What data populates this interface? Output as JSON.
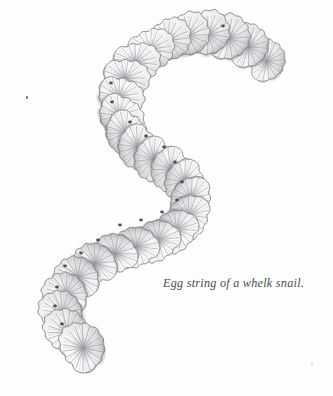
{
  "plate": {
    "medium": "graphite pencil drawing",
    "background_color": "#fefefe",
    "width": 333,
    "height": 396
  },
  "caption": {
    "text": "Egg string of a whelk snail.",
    "color": "#4c4c50",
    "style": "italic-serif",
    "x": 163,
    "y": 276
  },
  "illustration": {
    "subject": "egg string of a whelk snail",
    "name": "whelk-egg-string",
    "form": "S-curve chain of overlapping disc-shaped egg capsules",
    "capsule_count": 27,
    "ink_color": "#7d7d82",
    "shade_color": "#9a9aa0",
    "fill_color": "#fafafa",
    "aperture_color": "#3f3f44",
    "path": [
      {
        "x": 268,
        "y": 62,
        "r": 21,
        "rot": -72
      },
      {
        "x": 250,
        "y": 48,
        "r": 22,
        "rot": -64
      },
      {
        "x": 230,
        "y": 40,
        "r": 23,
        "rot": -52
      },
      {
        "x": 209,
        "y": 36,
        "r": 23,
        "rot": -40
      },
      {
        "x": 188,
        "y": 37,
        "r": 23,
        "rot": -28
      },
      {
        "x": 168,
        "y": 42,
        "r": 23,
        "rot": -14
      },
      {
        "x": 150,
        "y": 51,
        "r": 23,
        "rot": 2
      },
      {
        "x": 135,
        "y": 64,
        "r": 23,
        "rot": 16
      },
      {
        "x": 124,
        "y": 80,
        "r": 23,
        "rot": 28
      },
      {
        "x": 118,
        "y": 98,
        "r": 23,
        "rot": 40
      },
      {
        "x": 118,
        "y": 116,
        "r": 23,
        "rot": 54
      },
      {
        "x": 124,
        "y": 133,
        "r": 23,
        "rot": 66
      },
      {
        "x": 136,
        "y": 147,
        "r": 23,
        "rot": 76
      },
      {
        "x": 152,
        "y": 159,
        "r": 23,
        "rot": 84
      },
      {
        "x": 169,
        "y": 169,
        "r": 23,
        "rot": 90
      },
      {
        "x": 183,
        "y": 181,
        "r": 23,
        "rot": 100
      },
      {
        "x": 190,
        "y": 197,
        "r": 23,
        "rot": 118
      },
      {
        "x": 188,
        "y": 214,
        "r": 23,
        "rot": 136
      },
      {
        "x": 176,
        "y": 228,
        "r": 23,
        "rot": 152
      },
      {
        "x": 158,
        "y": 238,
        "r": 23,
        "rot": 164
      },
      {
        "x": 137,
        "y": 245,
        "r": 23,
        "rot": 176
      },
      {
        "x": 116,
        "y": 252,
        "r": 23,
        "rot": 188
      },
      {
        "x": 96,
        "y": 262,
        "r": 23,
        "rot": 200
      },
      {
        "x": 79,
        "y": 276,
        "r": 23,
        "rot": 212
      },
      {
        "x": 68,
        "y": 293,
        "r": 23,
        "rot": 224
      },
      {
        "x": 64,
        "y": 312,
        "r": 23,
        "rot": 238
      },
      {
        "x": 69,
        "y": 332,
        "r": 24,
        "rot": 250
      },
      {
        "x": 85,
        "y": 348,
        "r": 25,
        "rot": 260
      }
    ],
    "apertures": [
      {
        "x": 111,
        "y": 83
      },
      {
        "x": 112,
        "y": 102
      },
      {
        "x": 130,
        "y": 122
      },
      {
        "x": 146,
        "y": 136
      },
      {
        "x": 164,
        "y": 147
      },
      {
        "x": 175,
        "y": 162
      },
      {
        "x": 182,
        "y": 182
      },
      {
        "x": 177,
        "y": 200
      },
      {
        "x": 162,
        "y": 212
      },
      {
        "x": 141,
        "y": 220
      },
      {
        "x": 120,
        "y": 225
      },
      {
        "x": 98,
        "y": 240
      },
      {
        "x": 81,
        "y": 253
      },
      {
        "x": 65,
        "y": 266
      },
      {
        "x": 57,
        "y": 287
      },
      {
        "x": 55,
        "y": 306
      },
      {
        "x": 62,
        "y": 324
      },
      {
        "x": 223,
        "y": 26
      }
    ]
  },
  "marks": [
    {
      "name": "speck-upper-left",
      "x": 26,
      "y": 96,
      "color": "#6e6e72"
    },
    {
      "name": "speck-lower-right",
      "x": 311,
      "y": 363,
      "color": "#d8d8da"
    }
  ]
}
